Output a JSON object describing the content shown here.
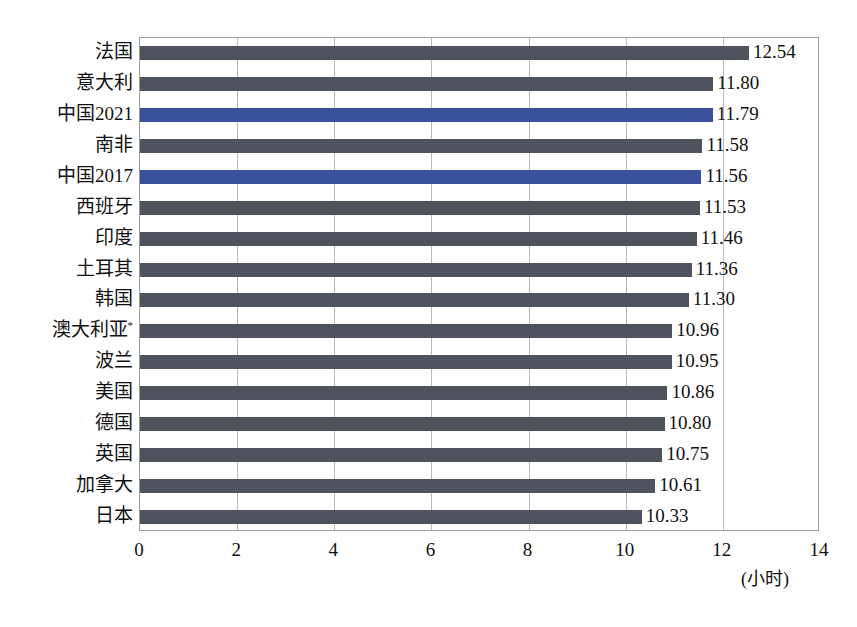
{
  "chart_data": {
    "type": "bar",
    "orientation": "horizontal",
    "title": "",
    "subtitle": "",
    "xlabel": "(小时)",
    "ylabel": "",
    "xlim": [
      0,
      14
    ],
    "xticks": [
      0,
      2,
      4,
      6,
      8,
      10,
      12,
      14
    ],
    "xtick_labels": [
      "0",
      "2",
      "4",
      "6",
      "8",
      "10",
      "12",
      "14"
    ],
    "grid": "vertical",
    "legend": "none",
    "categories": [
      "法国",
      "意大利",
      "中国2021",
      "南非",
      "中国2017",
      "西班牙",
      "印度",
      "土耳其",
      "韩国",
      "澳大利亚*",
      "波兰",
      "美国",
      "德国",
      "英国",
      "加拿大",
      "日本"
    ],
    "values": [
      12.54,
      11.8,
      11.79,
      11.58,
      11.56,
      11.53,
      11.46,
      11.36,
      11.3,
      10.96,
      10.95,
      10.86,
      10.8,
      10.75,
      10.61,
      10.33
    ],
    "value_labels": [
      "12.54",
      "11.80",
      "11.79",
      "11.58",
      "11.56",
      "11.53",
      "11.46",
      "11.36",
      "11.30",
      "10.96",
      "10.95",
      "10.86",
      "10.80",
      "10.75",
      "10.61",
      "10.33"
    ],
    "highlight_indices": [
      2,
      4
    ],
    "colors": {
      "bar_default": "#4e535e",
      "bar_highlight": "#3b519b",
      "gridline": "#b9b9b9",
      "axis_border": "#9a9a9a",
      "text": "#111111"
    },
    "footnote_marker": "*",
    "bottom_caption": ""
  }
}
